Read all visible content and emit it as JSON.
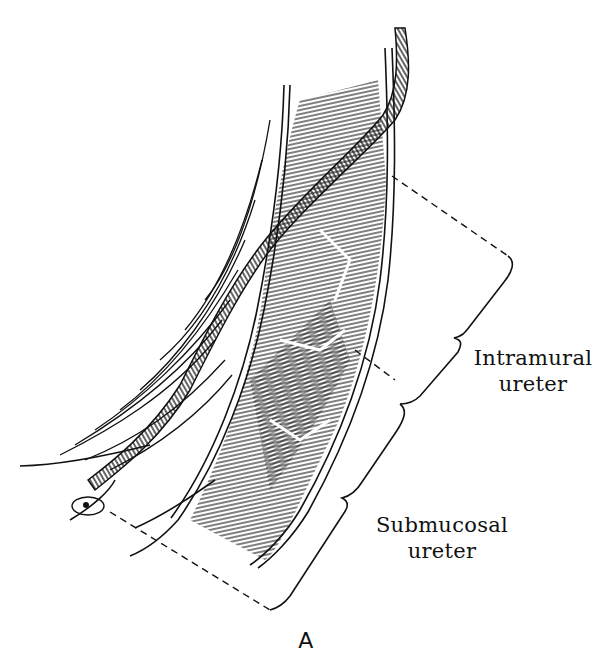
{
  "figure": {
    "panel_label": "A",
    "labels": {
      "intramural": {
        "line1": "Intramural",
        "line2": "ureter"
      },
      "submucosal": {
        "line1": "Submucosal",
        "line2": "ureter"
      }
    },
    "style": {
      "ink": "#111111",
      "background": "#ffffff"
    }
  }
}
